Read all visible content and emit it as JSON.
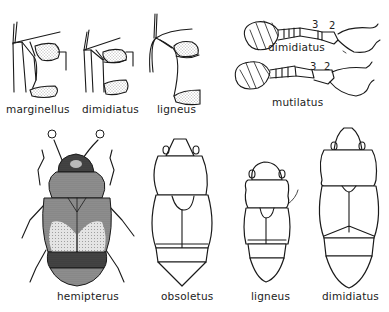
{
  "figure": {
    "top_row": {
      "leg_details": [
        {
          "label": "marginellus"
        },
        {
          "label": "dimidiatus"
        },
        {
          "label": "ligneus"
        }
      ],
      "antennae": [
        {
          "label": "dimidiatus",
          "segment_numbers": [
            "3",
            "2"
          ]
        },
        {
          "label": "mutilatus",
          "segment_numbers": [
            "3",
            "2"
          ]
        }
      ]
    },
    "bottom_row": {
      "beetles": [
        {
          "label": "hemipterus",
          "style": "shaded"
        },
        {
          "label": "obsoletus",
          "style": "outline"
        },
        {
          "label": "ligneus",
          "style": "outline"
        },
        {
          "label": "dimidiatus",
          "style": "outline"
        }
      ]
    },
    "colors": {
      "ink": "#1a1a1a",
      "background": "#ffffff"
    }
  }
}
